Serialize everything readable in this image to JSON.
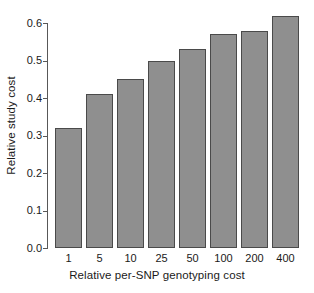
{
  "chart_data": {
    "type": "bar",
    "title": "",
    "xlabel": "Relative per-SNP genotyping cost",
    "ylabel": "Relative study cost",
    "categories": [
      "1",
      "5",
      "10",
      "25",
      "50",
      "100",
      "200",
      "400"
    ],
    "values": [
      0.32,
      0.41,
      0.45,
      0.5,
      0.53,
      0.57,
      0.58,
      0.62
    ],
    "ylim": [
      0.0,
      0.6
    ],
    "ytick_labels": [
      "0.0",
      "0.1",
      "0.2",
      "0.3",
      "0.4",
      "0.5",
      "0.6"
    ],
    "ytick_values": [
      0.0,
      0.1,
      0.2,
      0.3,
      0.4,
      0.5,
      0.6
    ],
    "grid": false,
    "legend": null,
    "legend_position": "none",
    "bar_fill_color": "#8f8f8f",
    "bar_border_color": "#4a4a4a",
    "axis_color": "#585858",
    "background_color": "#ffffff"
  }
}
